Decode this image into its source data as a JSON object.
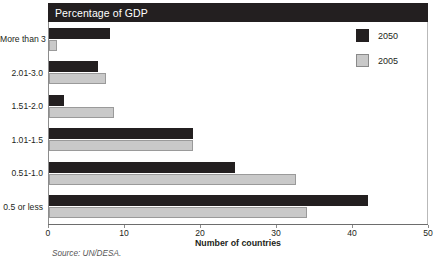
{
  "chart_data": {
    "type": "bar",
    "orientation": "horizontal",
    "title": "Percentage of GDP",
    "xlabel": "Number of countries",
    "ylabel": "",
    "xlim": [
      0,
      50
    ],
    "xticks": [
      0,
      10,
      20,
      30,
      40,
      50
    ],
    "grid": false,
    "legend_position": "top-right",
    "categories": [
      "More than 3",
      "2.01-3.0",
      "1.51-2.0",
      "1.01-1.5",
      "0.51-1.0",
      "0.5 or less"
    ],
    "series": [
      {
        "name": "2050",
        "color": "#231f20",
        "values": [
          8,
          6.5,
          2,
          19,
          24.5,
          42
        ]
      },
      {
        "name": "2005",
        "color": "#c9c9c9",
        "values": [
          1,
          7.5,
          8.5,
          19,
          32.5,
          34
        ]
      }
    ],
    "source": "Source: UN/DESA."
  },
  "legend": {
    "items": [
      {
        "label": "2050"
      },
      {
        "label": "2005"
      }
    ]
  },
  "colors": {
    "series_2050": "#231f20",
    "series_2005": "#c9c9c9",
    "title_band_bg": "#231f20",
    "title_band_text": "#ffffff",
    "axis": "#8c8c8c"
  }
}
